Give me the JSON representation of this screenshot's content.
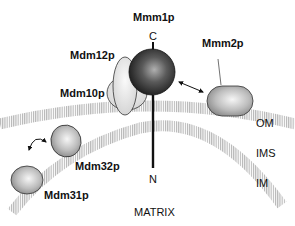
{
  "diagram": {
    "proteins": [
      {
        "id": "mmm1p",
        "label": "Mmm1p"
      },
      {
        "id": "mdm12p",
        "label": "Mdm12p"
      },
      {
        "id": "mdm10p",
        "label": "Mdm10p"
      },
      {
        "id": "mmm2p",
        "label": "Mmm2p"
      },
      {
        "id": "mdm32p",
        "label": "Mdm32p"
      },
      {
        "id": "mdm31p",
        "label": "Mdm31p"
      }
    ],
    "termini": {
      "c": "C",
      "n": "N"
    },
    "compartments": {
      "om": "OM",
      "ims": "IMS",
      "im": "IM",
      "matrix": "MATRIX"
    },
    "colors": {
      "membrane_stripe": "#b9b9b9",
      "sphere_dark": "#2a2a2a",
      "sphere_light": "#9a9a9a",
      "protein_light": "#e6e6e6",
      "protein_mid": "#a8a8a8",
      "line": "#111111"
    }
  }
}
